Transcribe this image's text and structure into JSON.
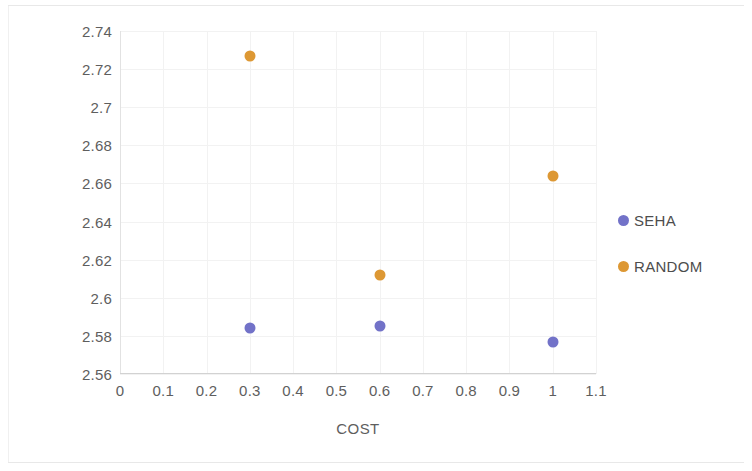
{
  "chart_data": {
    "type": "scatter",
    "title": "",
    "subtitle": "",
    "xlabel": "COST",
    "ylabel": "",
    "xlim": [
      0,
      1.1
    ],
    "ylim": [
      2.56,
      2.74
    ],
    "x_ticks": [
      "0",
      "0.1",
      "0.2",
      "0.3",
      "0.4",
      "0.5",
      "0.6",
      "0.7",
      "0.8",
      "0.9",
      "1",
      "1.1"
    ],
    "x_tick_values": [
      0,
      0.1,
      0.2,
      0.3,
      0.4,
      0.5,
      0.6,
      0.7,
      0.8,
      0.9,
      1.0,
      1.1
    ],
    "y_ticks": [
      "2.74",
      "2.72",
      "2.7",
      "2.68",
      "2.66",
      "2.64",
      "2.62",
      "2.6",
      "2.58",
      "2.56"
    ],
    "y_tick_values": [
      2.74,
      2.72,
      2.7,
      2.68,
      2.66,
      2.64,
      2.62,
      2.6,
      2.58,
      2.56
    ],
    "grid": true,
    "legend_position": "right",
    "series": [
      {
        "name": "SEHA",
        "color": "#7272c8",
        "marker": "circle",
        "x": [
          0.3,
          0.6,
          1.0
        ],
        "y": [
          2.584,
          2.585,
          2.577
        ]
      },
      {
        "name": "RANDOM",
        "color": "#dd9834",
        "marker": "circle",
        "x": [
          0.3,
          0.6,
          1.0
        ],
        "y": [
          2.727,
          2.612,
          2.664
        ]
      }
    ]
  },
  "legend": {
    "items": [
      {
        "label": "SEHA",
        "color": "#7272c8"
      },
      {
        "label": "RANDOM",
        "color": "#dd9834"
      }
    ]
  }
}
